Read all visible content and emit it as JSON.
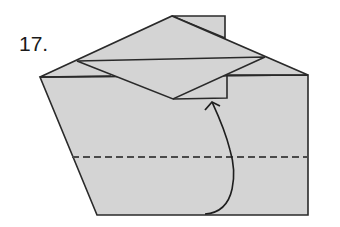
{
  "step": {
    "number_label": "17."
  },
  "colors": {
    "paper_fill": "#d4d4d4",
    "outline": "#2a2a2a",
    "dashed_line": "#4a4a4a",
    "arrow": "#1e1e1e",
    "background": "#ffffff"
  },
  "diagram": {
    "fold_line_type": "valley fold (dashed)",
    "arrow_type": "curved fold arrow"
  }
}
